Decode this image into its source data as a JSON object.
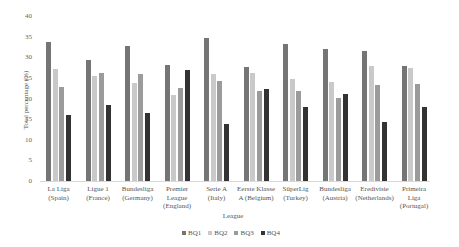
{
  "chart_data": {
    "type": "bar",
    "title": "",
    "xlabel": "League",
    "ylabel": "Total percentage (%)",
    "ylim": [
      0,
      40
    ],
    "yticks": [
      0,
      5,
      10,
      15,
      20,
      25,
      30,
      35,
      40
    ],
    "grid": false,
    "legend_position": "bottom",
    "categories": [
      "La Liga (Spain)",
      "Ligue 1 (France)",
      "Bundesliga (Germany)",
      "Premier League (England)",
      "Serie A (Italy)",
      "Eerste Klasse A (Belgium)",
      "SüperLig (Turkey)",
      "Bundesliga (Austria)",
      "Eredivisie (Netherlands)",
      "Primeira Liga (Portugal)"
    ],
    "category_lines": [
      [
        "La Liga",
        "(Spain)"
      ],
      [
        "Ligue 1",
        "(France)"
      ],
      [
        "Bundesliga",
        "(Germany)"
      ],
      [
        "Premier",
        "League",
        "(England)"
      ],
      [
        "Serie A",
        "(Italy)"
      ],
      [
        "Eerste Klasse",
        "A (Belgium)"
      ],
      [
        "SüperLig",
        "(Turkey)"
      ],
      [
        "Bundesliga",
        "(Austria)"
      ],
      [
        "Eredivisie",
        "(Netherlands)"
      ],
      [
        "Primeira",
        "Liga",
        "(Portugal)"
      ]
    ],
    "series": [
      {
        "name": "BQ1",
        "color": "#757575",
        "values": [
          33.7,
          29.3,
          32.7,
          28.2,
          34.6,
          27.6,
          33.1,
          32.1,
          31.6,
          27.8
        ]
      },
      {
        "name": "BQ2",
        "color": "#c9c9c9",
        "values": [
          27.1,
          25.5,
          23.7,
          20.9,
          25.9,
          26.1,
          24.7,
          24.0,
          27.9,
          27.3
        ]
      },
      {
        "name": "BQ3",
        "color": "#9b9b9b",
        "values": [
          22.7,
          26.1,
          26.0,
          22.6,
          24.3,
          21.8,
          21.8,
          20.1,
          23.3,
          23.4
        ]
      },
      {
        "name": "BQ4",
        "color": "#333333",
        "values": [
          16.0,
          18.4,
          16.5,
          26.8,
          13.8,
          22.2,
          18.0,
          21.2,
          14.2,
          18.0
        ]
      }
    ]
  }
}
